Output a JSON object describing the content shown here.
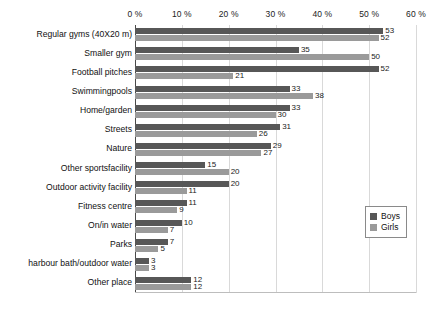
{
  "chart_data": {
    "type": "bar",
    "orientation": "horizontal",
    "title": "",
    "xlabel": "",
    "ylabel": "",
    "xlim": [
      0,
      60
    ],
    "grid": true,
    "legend_position": "right",
    "tick_labels": [
      "0 %",
      "10 %",
      "20 %",
      "30 %",
      "40 %",
      "50 %",
      "60 %"
    ],
    "tick_values": [
      0,
      10,
      20,
      30,
      40,
      50,
      60
    ],
    "categories": [
      "Regular gyms (40X20 m)",
      "Smaller gym",
      "Football pitches",
      "Swimmingpools",
      "Home/garden",
      "Streets",
      "Nature",
      "Other sportsfacility",
      "Outdoor activity facility",
      "Fitness centre",
      "On/in water",
      "Parks",
      "harbour bath/outdoor water",
      "Other place"
    ],
    "series": [
      {
        "name": "Boys",
        "color": "#575757",
        "values": [
          53,
          35,
          52,
          33,
          33,
          31,
          29,
          15,
          20,
          11,
          10,
          7,
          3,
          12
        ]
      },
      {
        "name": "Girls",
        "color": "#9a9a9a",
        "values": [
          52,
          50,
          21,
          38,
          30,
          26,
          27,
          20,
          11,
          9,
          7,
          5,
          3,
          12
        ]
      }
    ]
  },
  "legend": {
    "items": [
      {
        "label": "Boys",
        "swatch": "boys"
      },
      {
        "label": "Girls",
        "swatch": "girls"
      }
    ]
  }
}
